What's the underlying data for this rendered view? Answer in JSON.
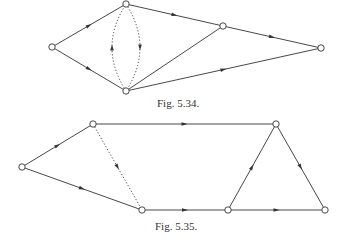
{
  "colors": {
    "stroke": "#333333",
    "node_fill": "#ffffff",
    "background": "#ffffff"
  },
  "figures": [
    {
      "caption": "Fig. 5.34.",
      "caption_pos": {
        "x": 157,
        "y": 97
      },
      "nodes": [
        {
          "id": "a",
          "x": 52,
          "y": 47
        },
        {
          "id": "b",
          "x": 126,
          "y": 4
        },
        {
          "id": "c",
          "x": 126,
          "y": 91
        },
        {
          "id": "d",
          "x": 223,
          "y": 26
        },
        {
          "id": "e",
          "x": 321,
          "y": 48
        }
      ],
      "edges": [
        {
          "from": "a",
          "to": "b",
          "style": "solid",
          "arrow": true
        },
        {
          "from": "a",
          "to": "c",
          "style": "solid",
          "arrow": true
        },
        {
          "from": "b",
          "to": "d",
          "style": "solid",
          "arrow": true
        },
        {
          "from": "c",
          "to": "d",
          "style": "solid",
          "arrow": false
        },
        {
          "from": "d",
          "to": "e",
          "style": "solid",
          "arrow": true
        },
        {
          "from": "c",
          "to": "e",
          "style": "solid",
          "arrow": true
        },
        {
          "from": "b",
          "to": "c",
          "style": "dotted",
          "arrow": true,
          "curve": -14
        },
        {
          "from": "c",
          "to": "b",
          "style": "dotted",
          "arrow": true,
          "curve": -14
        }
      ]
    },
    {
      "caption": "Fig. 5.35.",
      "caption_pos": {
        "x": 155,
        "y": 220
      },
      "nodes": [
        {
          "id": "a",
          "x": 22,
          "y": 167
        },
        {
          "id": "b",
          "x": 93,
          "y": 124
        },
        {
          "id": "c",
          "x": 142,
          "y": 210
        },
        {
          "id": "d",
          "x": 276,
          "y": 124
        },
        {
          "id": "e",
          "x": 228,
          "y": 210
        },
        {
          "id": "f",
          "x": 325,
          "y": 210
        }
      ],
      "edges": [
        {
          "from": "a",
          "to": "b",
          "style": "solid",
          "arrow": true
        },
        {
          "from": "a",
          "to": "c",
          "style": "solid",
          "arrow": true
        },
        {
          "from": "b",
          "to": "d",
          "style": "solid",
          "arrow": true
        },
        {
          "from": "b",
          "to": "c",
          "style": "dotted",
          "arrow": true
        },
        {
          "from": "c",
          "to": "e",
          "style": "solid",
          "arrow": true
        },
        {
          "from": "e",
          "to": "d",
          "style": "solid",
          "arrow": true
        },
        {
          "from": "d",
          "to": "f",
          "style": "solid",
          "arrow": true
        },
        {
          "from": "e",
          "to": "f",
          "style": "solid",
          "arrow": true
        }
      ]
    }
  ]
}
